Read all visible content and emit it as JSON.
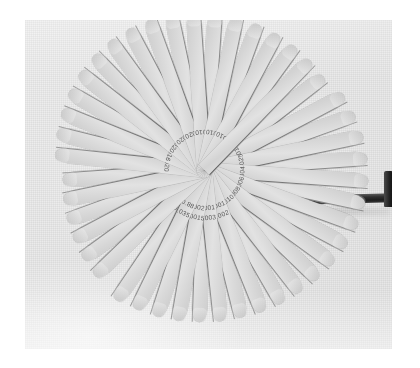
{
  "image": {
    "subject": "feeler-gauge-set",
    "caption": "",
    "print_background": "#ffffff",
    "photo_background": "#e9e9e9",
    "blade_color": "#d7d7d7",
    "blade_edge_color": "#4a4a4a",
    "dark_blade_color": "#1f1f1f",
    "hub_color": "#dcdcdc",
    "mark_color": "#3a3a3a",
    "photo": {
      "left": 25,
      "top": 20,
      "width": 367,
      "height": 329
    },
    "hub": {
      "cx": 204,
      "cy": 170,
      "r": 18
    }
  },
  "gauge": {
    "blade_count": 28,
    "pivot_label": "pivot-rivet",
    "handle_label": "end-blade-handle",
    "fan_start_angle": -118,
    "fan_end_angle": 86,
    "blades": [
      {
        "angle": -118,
        "length": 158,
        "width": 15,
        "mark1": ".0015",
        "mark2": ""
      },
      {
        "angle": -110,
        "length": 160,
        "width": 15,
        "mark1": ".002",
        "mark2": ""
      },
      {
        "angle": -102,
        "length": 162,
        "width": 15,
        "mark1": ".0025",
        "mark2": ""
      },
      {
        "angle": -94,
        "length": 163,
        "width": 15,
        "mark1": ".003",
        "mark2": ""
      },
      {
        "angle": -86,
        "length": 164,
        "width": 15,
        "mark1": ".004",
        "mark2": ""
      },
      {
        "angle": -78,
        "length": 164,
        "width": 15,
        "mark1": ".005",
        "mark2": ""
      },
      {
        "angle": -70,
        "length": 163,
        "width": 15,
        "mark1": ".006",
        "mark2": ""
      },
      {
        "angle": -62,
        "length": 161,
        "width": 15,
        "mark1": ".007",
        "mark2": ""
      },
      {
        "angle": -54,
        "length": 159,
        "width": 15,
        "mark1": ".008",
        "mark2": ""
      },
      {
        "angle": -46,
        "length": 157,
        "width": 15,
        "mark1": ".009",
        "mark2": ""
      },
      {
        "angle": -38,
        "length": 155,
        "width": 15,
        "mark1": ".010",
        "mark2": ""
      },
      {
        "angle": -30,
        "length": 154,
        "width": 15,
        "mark1": ".001",
        "mark2": ".0015"
      },
      {
        "angle": -22,
        "length": 153,
        "width": 15,
        "mark1": ".001",
        "mark2": ".002"
      },
      {
        "angle": -14,
        "length": 152,
        "width": 15,
        "mark1": ".001",
        "mark2": ".0025"
      },
      {
        "angle": -6,
        "length": 152,
        "width": 15,
        "mark1": ".001",
        "mark2": ".003"
      },
      {
        "angle": 2,
        "length": 152,
        "width": 15,
        "mark1": ".001",
        "mark2": ".004"
      },
      {
        "angle": 10,
        "length": 153,
        "width": 15,
        "mark1": ".002",
        "mark2": ".0015"
      },
      {
        "angle": 18,
        "length": 154,
        "width": 15,
        "mark1": ".002",
        "mark2": ".002"
      },
      {
        "angle": 26,
        "length": 155,
        "width": 15,
        "mark1": "0.88",
        "mark2": ".035"
      },
      {
        "angle": 34,
        "length": 157,
        "width": 15,
        "mark1": "0.88",
        "mark2": ".035"
      },
      {
        "angle": 46,
        "length": 152,
        "width": 15,
        "mark1": "",
        "mark2": ""
      },
      {
        "angle": 54,
        "length": 150,
        "width": 15,
        "mark1": "",
        "mark2": ""
      },
      {
        "angle": 62,
        "length": 148,
        "width": 15,
        "mark1": "",
        "mark2": ""
      },
      {
        "angle": 70,
        "length": 146,
        "width": 15,
        "mark1": "",
        "mark2": ""
      },
      {
        "angle": 78,
        "length": 144,
        "width": 15,
        "mark1": "",
        "mark2": ""
      },
      {
        "angle": 86,
        "length": 142,
        "width": 15,
        "mark1": "",
        "mark2": ""
      }
    ],
    "lower_blades": [
      {
        "angle": 96,
        "length": 150,
        "width": 15,
        "mark1": "020",
        "mark2": ""
      },
      {
        "angle": 104,
        "length": 152,
        "width": 15,
        "mark1": "018",
        "mark2": ""
      },
      {
        "angle": 112,
        "length": 154,
        "width": 15,
        "mark1": "016",
        "mark2": ""
      },
      {
        "angle": 120,
        "length": 156,
        "width": 15,
        "mark1": "010",
        "mark2": ""
      },
      {
        "angle": 128,
        "length": 158,
        "width": 15,
        "mark1": ".020",
        "mark2": ""
      },
      {
        "angle": 136,
        "length": 159,
        "width": 15,
        "mark1": ".020",
        "mark2": ""
      },
      {
        "angle": 144,
        "length": 160,
        "width": 15,
        "mark1": ".020",
        "mark2": ""
      },
      {
        "angle": 152,
        "length": 160,
        "width": 15,
        "mark1": ".020",
        "mark2": ""
      },
      {
        "angle": 160,
        "length": 160,
        "width": 15,
        "mark1": ".020",
        "mark2": ""
      },
      {
        "angle": 168,
        "length": 159,
        "width": 15,
        "mark1": ".020",
        "mark2": ""
      },
      {
        "angle": 176,
        "length": 158,
        "width": 15,
        "mark1": ".010",
        "mark2": ""
      },
      {
        "angle": 184,
        "length": 157,
        "width": 15,
        "mark1": ".010",
        "mark2": ""
      },
      {
        "angle": 192,
        "length": 156,
        "width": 15,
        "mark1": ".010",
        "mark2": ""
      },
      {
        "angle": 200,
        "length": 155,
        "width": 15,
        "mark1": ".010",
        "mark2": ""
      },
      {
        "angle": 208,
        "length": 154,
        "width": 15,
        "mark1": ".010",
        "mark2": ""
      },
      {
        "angle": 216,
        "length": 153,
        "width": 15,
        "mark1": ".010",
        "mark2": ""
      },
      {
        "angle": 224,
        "length": 152,
        "width": 15,
        "mark1": "",
        "mark2": ""
      },
      {
        "angle": 232,
        "length": 151,
        "width": 15,
        "mark1": "",
        "mark2": ""
      }
    ]
  }
}
